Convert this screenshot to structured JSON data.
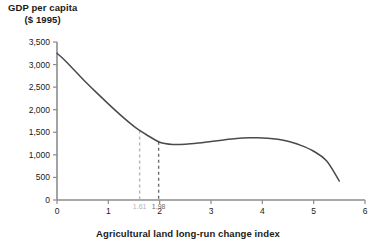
{
  "chart_data": {
    "type": "line",
    "title": "GDP per capita ($ 1995)",
    "title_line1": "GDP per capita",
    "title_line2": "($ 1995)",
    "xlabel": "Agricultural land long-run change index",
    "ylabel": "GDP per capita ($ 1995)",
    "xlim": [
      0,
      6
    ],
    "ylim": [
      0,
      3500
    ],
    "grid": false,
    "legend": "none",
    "x_ticks": [
      "0",
      "1",
      "2",
      "3",
      "4",
      "5",
      "6"
    ],
    "x_tick_values": [
      0,
      1,
      2,
      3,
      4,
      5,
      6
    ],
    "y_ticks": [
      "0",
      "500",
      "1,000",
      "1,500",
      "2,000",
      "2,500",
      "3,000",
      "3,500"
    ],
    "y_tick_values": [
      0,
      500,
      1000,
      1500,
      2000,
      2500,
      3000,
      3500
    ],
    "series": [
      {
        "name": "GDP per capita",
        "color": "#4a4a4a",
        "x": [
          0,
          0.1,
          0.25,
          0.5,
          0.75,
          1.0,
          1.25,
          1.5,
          1.61,
          1.75,
          1.98,
          2.1,
          2.25,
          2.5,
          2.75,
          3.0,
          3.25,
          3.5,
          3.75,
          3.9,
          4.1,
          4.3,
          4.5,
          4.75,
          5.0,
          5.25,
          5.5
        ],
        "y": [
          3250,
          3150,
          2980,
          2680,
          2400,
          2130,
          1870,
          1630,
          1540,
          1440,
          1290,
          1250,
          1230,
          1235,
          1260,
          1295,
          1330,
          1360,
          1378,
          1380,
          1370,
          1345,
          1300,
          1210,
          1080,
          870,
          420
        ]
      }
    ],
    "markers": [
      {
        "name": "marker-1",
        "x": 1.61,
        "label": "1.61",
        "y_top": 1540,
        "color": "#b4b4b4"
      },
      {
        "name": "marker-2",
        "x": 1.98,
        "label": "1.98",
        "y_top": 1290,
        "color": "#6e6e6e"
      }
    ]
  }
}
